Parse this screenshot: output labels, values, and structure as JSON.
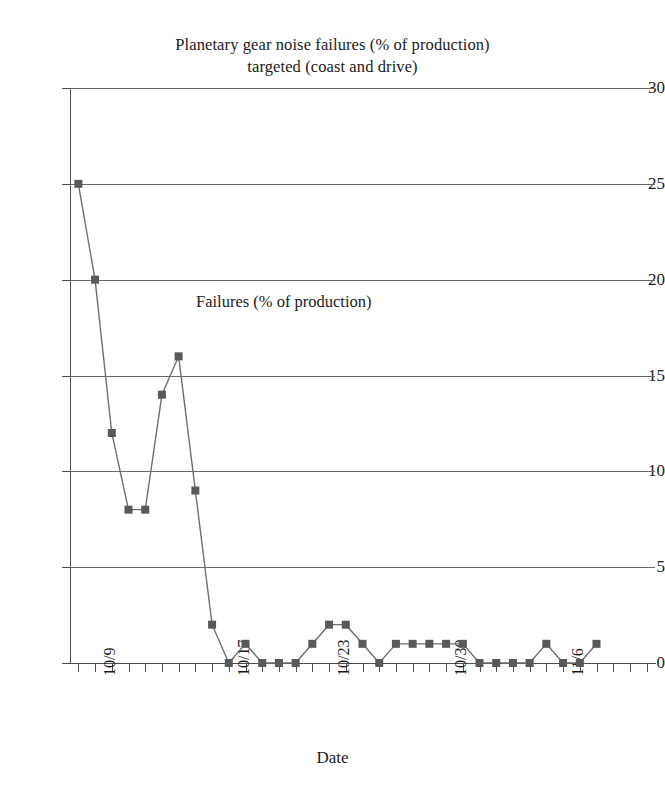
{
  "chart_data": {
    "type": "line",
    "title": "Planetary gear noise failures (% of production) targeted (coast and drive)",
    "title_line1": "Planetary gear noise failures (% of production)",
    "title_line2": "targeted (coast and drive)",
    "xlabel": "Date",
    "ylabel": "",
    "series_annotation": "Failures (% of production)",
    "ylim": [
      0,
      30
    ],
    "ytick_values": [
      30,
      25,
      20,
      15,
      10,
      5,
      0
    ],
    "ytick_labels": [
      "30",
      "25",
      "20",
      "15",
      "10",
      "5",
      "0"
    ],
    "grid": "horizontal",
    "legend": "none",
    "marker": "square",
    "marker_color": "#595959",
    "line_color": "#6e6e6e",
    "gridline_color": "#6b6b6b",
    "axis_color": "#4d4d4d",
    "background": "#ffffff",
    "x_tick_label_positions": [
      1,
      9,
      15,
      22,
      29
    ],
    "xtick_labels": [
      "10/9",
      "10/17",
      "10/23",
      "10/30",
      "11/6"
    ],
    "x_index_count": 35,
    "series": [
      {
        "name": "Failures (% of production)",
        "values": [
          25,
          20,
          12,
          8,
          8,
          14,
          16,
          9,
          2,
          0,
          1,
          0,
          0,
          0,
          1,
          2,
          2,
          1,
          0,
          1,
          1,
          1,
          1,
          1,
          0,
          0,
          0,
          0,
          1,
          0,
          0,
          1
        ]
      }
    ]
  }
}
